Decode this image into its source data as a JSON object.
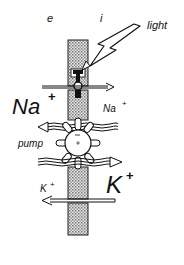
{
  "diagram": {
    "sides": {
      "extracellular": "e",
      "intracellular": "i"
    },
    "labels": {
      "light": "light",
      "na_large": "Na",
      "na_large_sup": "+",
      "na_small": "Na",
      "na_small_sup": "+",
      "pump": "pump",
      "k_small": "K",
      "k_small_sup": "+",
      "k_large": "K",
      "k_large_sup": "+"
    },
    "arrows": [
      {
        "name": "na-channel-flux",
        "direction": "right",
        "type": "single"
      },
      {
        "name": "na-pump-flux",
        "direction": "left",
        "type": "wavy"
      },
      {
        "name": "k-pump-flux",
        "direction": "right",
        "type": "wavy"
      },
      {
        "name": "k-leak-flux",
        "direction": "left",
        "type": "single"
      }
    ],
    "colors": {
      "ink": "#111111",
      "membrane": "#bdbdbd",
      "background": "#ffffff"
    }
  }
}
